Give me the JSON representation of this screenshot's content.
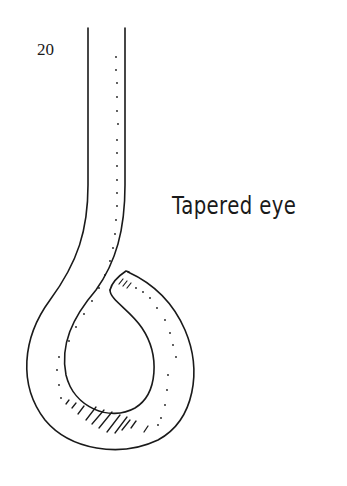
{
  "page": {
    "number": "20",
    "caption": "Tapered eye"
  },
  "diagram": {
    "eye_type": "tapered",
    "line_color": "#1a1a1a",
    "background": "#ffffff"
  }
}
